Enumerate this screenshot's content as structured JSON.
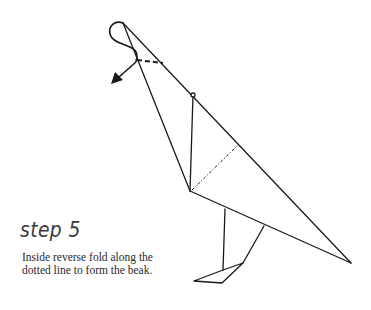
{
  "step": {
    "title": "step 5",
    "instruction_lines": [
      "Inside reverse fold along the",
      "dotted line to form the beak."
    ]
  },
  "diagram": {
    "stroke_color": "#1a1a1a",
    "background": "#ffffff",
    "elements": [
      "head-loop-curve",
      "fold-direction-arrow",
      "beak-dashed-fold-line",
      "neck-outer-edge",
      "neck-inner-edge",
      "neck-crease-line",
      "body-dotted-crease",
      "body-bottom-edge",
      "front-leg",
      "back-leg",
      "foot"
    ]
  }
}
